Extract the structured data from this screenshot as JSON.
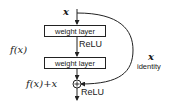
{
  "diagram": {
    "input_label": "x",
    "layers": [
      {
        "label": "weight layer"
      },
      {
        "label": "weight layer"
      }
    ],
    "activation_between": "ReLU",
    "activation_after": "ReLU",
    "residual_function_label": "f(x)",
    "sum_label": "f(x)+x",
    "shortcut": {
      "variable": "x",
      "label": "identity"
    },
    "add_symbol": "+",
    "colors": {
      "stroke": "#222222",
      "background": "#ffffff",
      "text": "#1a1a1a"
    }
  }
}
